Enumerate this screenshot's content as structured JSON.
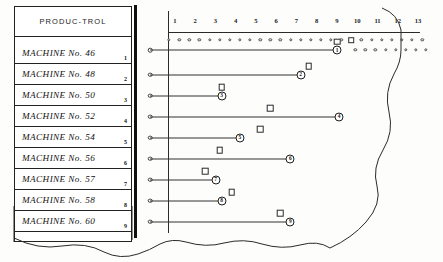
{
  "header": {
    "title": "PRODUC-TROL"
  },
  "columns": {
    "labels": [
      "1",
      "2",
      "3",
      "4",
      "5",
      "6",
      "7",
      "8",
      "9",
      "10",
      "11",
      "12",
      "13"
    ],
    "x_start": 175,
    "x_step": 20.25
  },
  "top_strip": {
    "dot_count": 26,
    "square_index": 18,
    "row1_dots_after": 8
  },
  "rows": [
    {
      "label": "MACHINE   No. 46",
      "num": "1",
      "bar_end_col": 9.0,
      "marker_col": 9.0,
      "marker_above": true,
      "end_label": "1"
    },
    {
      "label": "MACHINE   No. 48",
      "num": "2",
      "bar_end_col": 7.2,
      "marker_col": 7.6,
      "marker_above": true,
      "end_label": "2"
    },
    {
      "label": "MACHINE   No. 50",
      "num": "3",
      "bar_end_col": 3.3,
      "marker_col": 3.3,
      "marker_above": true,
      "end_label": "3"
    },
    {
      "label": "MACHINE   No. 52",
      "num": "4",
      "bar_end_col": 9.1,
      "marker_col": 5.7,
      "marker_above": true,
      "end_label": "4"
    },
    {
      "label": "MACHINE   No. 54",
      "num": "5",
      "bar_end_col": 4.2,
      "marker_col": 5.2,
      "marker_above": true,
      "end_label": "5"
    },
    {
      "label": "MACHINE   No. 56",
      "num": "6",
      "bar_end_col": 6.7,
      "marker_col": 3.2,
      "marker_above": true,
      "end_label": "6"
    },
    {
      "label": "MACHINE   No. 57",
      "num": "7",
      "bar_end_col": 3.0,
      "marker_col": 2.5,
      "marker_above": true,
      "end_label": "7"
    },
    {
      "label": "MACHINE   No. 58",
      "num": "8",
      "bar_end_col": 3.3,
      "marker_col": 3.8,
      "marker_above": true,
      "end_label": "8"
    },
    {
      "label": "MACHINE   No. 60",
      "num": "9",
      "bar_end_col": 6.7,
      "marker_col": 6.2,
      "marker_above": true,
      "end_label": "9"
    }
  ],
  "colors": {
    "ink": "#1a1a1a",
    "rule": "#2a2a2a",
    "paper": "#fdfdfc"
  },
  "chart_data": {
    "type": "bar",
    "title": "PRODUC-TROL",
    "orientation": "horizontal",
    "xlabel": "",
    "ylabel": "",
    "xlim": [
      0,
      13
    ],
    "grid": false,
    "legend": "none",
    "categories": [
      "MACHINE No. 46",
      "MACHINE No. 48",
      "MACHINE No. 50",
      "MACHINE No. 52",
      "MACHINE No. 54",
      "MACHINE No. 56",
      "MACHINE No. 57",
      "MACHINE No. 58",
      "MACHINE No. 60"
    ],
    "series": [
      {
        "name": "Progress (bar end, circled row number)",
        "values": [
          9.0,
          7.2,
          3.3,
          9.1,
          4.2,
          6.7,
          3.0,
          3.3,
          6.7
        ]
      },
      {
        "name": "Schedule marker (square)",
        "values": [
          9.0,
          7.6,
          3.3,
          5.7,
          5.2,
          3.2,
          2.5,
          3.8,
          6.2
        ]
      }
    ],
    "tick_labels": [
      "1",
      "2",
      "3",
      "4",
      "5",
      "6",
      "7",
      "8",
      "9",
      "10",
      "11",
      "12",
      "13"
    ]
  }
}
